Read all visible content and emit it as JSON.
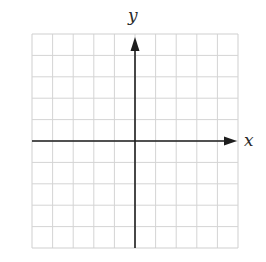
{
  "diagram": {
    "type": "coordinate-grid",
    "grid": {
      "columns": 10,
      "rows": 10,
      "left": 32,
      "top": 34,
      "width": 206,
      "height": 214,
      "line_color": "#d4d4d4",
      "border_color": "#cfcfcf"
    },
    "axes": {
      "color": "#1e1e1e",
      "origin_column": 5,
      "origin_row": 5,
      "x_axis": {
        "label": "x",
        "direction": "right",
        "arrow": true
      },
      "y_axis": {
        "label": "y",
        "direction": "up",
        "arrow": true
      }
    }
  }
}
